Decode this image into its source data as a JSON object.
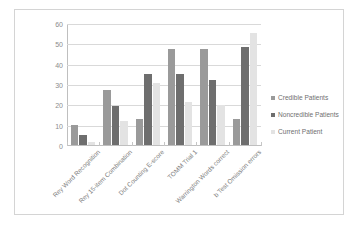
{
  "chart_data": {
    "type": "bar",
    "title": "",
    "xlabel": "",
    "ylabel": "",
    "ylim": [
      0,
      60
    ],
    "ytick_step": 10,
    "yticks": [
      0,
      10,
      20,
      30,
      40,
      50,
      60
    ],
    "grid": true,
    "legend_position": "right",
    "categories": [
      "Rey Word Recognition",
      "Rey 15-item Combination",
      "Dot Counting E-score",
      "TOMM Trial 1",
      "Warrington Words correct",
      "b Test Omission errors"
    ],
    "series": [
      {
        "name": "Credible Patients",
        "color": "#9a9a9a",
        "values": [
          10,
          27,
          13,
          47,
          47,
          13
        ]
      },
      {
        "name": "Noncredible Patients",
        "color": "#6e6e6e",
        "values": [
          5,
          19,
          35,
          35,
          32,
          48
        ]
      },
      {
        "name": "Current Patient",
        "color": "#e3e3e3",
        "values": [
          1.5,
          12,
          30.5,
          21,
          19.5,
          55
        ]
      }
    ]
  }
}
